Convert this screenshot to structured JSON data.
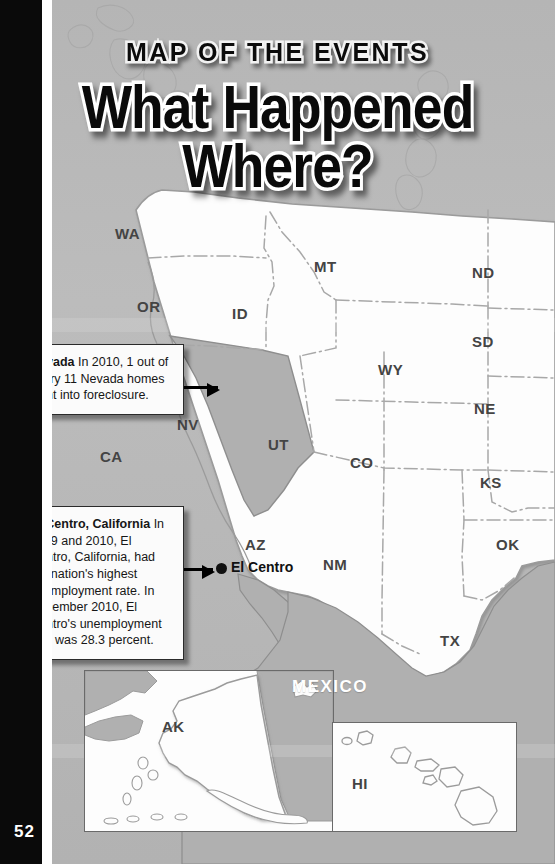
{
  "page": {
    "number": "52",
    "kicker": "MAP OF THE EVENTS",
    "headline_line1": "What Happened",
    "headline_line2": "Where?"
  },
  "map": {
    "ocean_color": "#b9b9b9",
    "land_color": "#fdfdfd",
    "highlight_color": "#b0b0b0",
    "border_color": "#9a9a9a",
    "state_labels": [
      {
        "abbr": "WA",
        "x": 115,
        "y": 225
      },
      {
        "abbr": "OR",
        "x": 137,
        "y": 298
      },
      {
        "abbr": "ID",
        "x": 232,
        "y": 305
      },
      {
        "abbr": "MT",
        "x": 314,
        "y": 258
      },
      {
        "abbr": "ND",
        "x": 472,
        "y": 264
      },
      {
        "abbr": "SD",
        "x": 472,
        "y": 333
      },
      {
        "abbr": "WY",
        "x": 378,
        "y": 361
      },
      {
        "abbr": "NE",
        "x": 474,
        "y": 400
      },
      {
        "abbr": "NV",
        "x": 177,
        "y": 416
      },
      {
        "abbr": "UT",
        "x": 268,
        "y": 436
      },
      {
        "abbr": "CA",
        "x": 100,
        "y": 448
      },
      {
        "abbr": "CO",
        "x": 350,
        "y": 454
      },
      {
        "abbr": "KS",
        "x": 480,
        "y": 474
      },
      {
        "abbr": "AZ",
        "x": 245,
        "y": 536
      },
      {
        "abbr": "NM",
        "x": 323,
        "y": 556
      },
      {
        "abbr": "OK",
        "x": 496,
        "y": 536
      },
      {
        "abbr": "TX",
        "x": 440,
        "y": 632
      }
    ],
    "inset_labels": [
      {
        "abbr": "AK",
        "x": 162,
        "y": 718
      },
      {
        "abbr": "HI",
        "x": 352,
        "y": 775
      }
    ],
    "country_labels": [
      {
        "name": "MEXICO",
        "x": 292,
        "y": 677
      }
    ],
    "city": {
      "name": "El Centro",
      "dot_x": 216,
      "dot_y": 563,
      "label_x": 231,
      "label_y": 559
    }
  },
  "callouts": [
    {
      "id": "nevada",
      "title": "Nevada",
      "body": "In 2010, 1 out of every 11 Nevada homes went into foreclosure.",
      "x": 18,
      "y": 344,
      "width": 142,
      "arrow_x": 163,
      "arrow_y": 386,
      "arrow_w": 55
    },
    {
      "id": "el-centro",
      "title": "El Centro, California",
      "body": "In 2009 and 2010, El Centro, California, had the nation's highest unemployment rate. In December 2010, El Centro's unemployment rate was 28.3 percent.",
      "x": 18,
      "y": 506,
      "width": 142,
      "arrow_x": 163,
      "arrow_y": 568,
      "arrow_w": 50
    }
  ]
}
